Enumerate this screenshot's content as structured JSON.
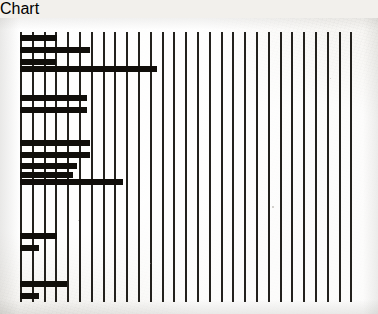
{
  "figure": {
    "title": "",
    "caption": "",
    "background_color": "#f3f1ed",
    "ink_color": "#100e0a"
  },
  "chart_data": {
    "type": "bar",
    "orientation": "horizontal",
    "title": "",
    "subtitle": "",
    "xlabel": "",
    "ylabel": "",
    "grid": true,
    "grid_axis": "x",
    "legend": false,
    "legend_position": "none",
    "axis_ranges": {
      "x_pixels": [
        20,
        362
      ],
      "y_pixels": [
        14,
        284
      ],
      "x_units": [
        0,
        29
      ],
      "y_units": [
        0,
        23
      ]
    },
    "gridline_count": 29,
    "gridline_spacing_px": 11.8,
    "gridline_x_positions": [
      20,
      31.8,
      43.6,
      55.4,
      67.2,
      79,
      90.8,
      102.6,
      114.4,
      126.2,
      138,
      149.8,
      161.6,
      173.4,
      185.2,
      197,
      208.8,
      220.6,
      232.4,
      244.2,
      256,
      267.8,
      279.6,
      291.4,
      303.2,
      315,
      326.8,
      338.6,
      350.4
    ],
    "gridline_top_px": 14,
    "gridline_bottom_px": 284,
    "bar_origin_x_px": 20,
    "bar_height_px": 6,
    "bar_pitch_px": 12,
    "categories": [
      "1",
      "2",
      "3",
      "4",
      "5",
      "6",
      "7",
      "8",
      "9",
      "10",
      "11",
      "12",
      "13",
      "14",
      "15",
      "16",
      "17",
      "18",
      "19",
      "20",
      "21",
      "22",
      "23"
    ],
    "values": [
      3.1,
      0,
      5.9,
      0,
      3.0,
      11.6,
      0,
      0,
      5.7,
      5.7,
      0,
      0,
      5.9,
      4.8,
      4.5,
      8.7,
      0,
      0,
      0,
      3.1,
      1.6,
      0,
      4.0
    ],
    "bars": [
      {
        "index": 0,
        "label": "1",
        "y_px": 17,
        "x_start_px": 20,
        "x_end_px": 57,
        "length_px": 37,
        "value": 3.1
      },
      {
        "index": 1,
        "label": "2",
        "y_px": 29,
        "x_start_px": 20,
        "x_end_px": 90,
        "length_px": 70,
        "value": 5.9
      },
      {
        "index": 2,
        "label": "3",
        "y_px": 41,
        "x_start_px": 20,
        "x_end_px": 56,
        "length_px": 36,
        "value": 3.0
      },
      {
        "index": 3,
        "label": "4",
        "y_px": 48,
        "x_start_px": 20,
        "x_end_px": 157,
        "length_px": 137,
        "value": 11.6
      },
      {
        "index": 4,
        "label": "5",
        "y_px": 77,
        "x_start_px": 20,
        "x_end_px": 87,
        "length_px": 67,
        "value": 5.7
      },
      {
        "index": 5,
        "label": "6",
        "y_px": 89,
        "x_start_px": 20,
        "x_end_px": 87,
        "length_px": 67,
        "value": 5.7
      },
      {
        "index": 6,
        "label": "7",
        "y_px": 122,
        "x_start_px": 20,
        "x_end_px": 90,
        "length_px": 70,
        "value": 5.9
      },
      {
        "index": 7,
        "label": "8",
        "y_px": 134,
        "x_start_px": 20,
        "x_end_px": 90,
        "length_px": 70,
        "value": 5.9
      },
      {
        "index": 8,
        "label": "9",
        "y_px": 145,
        "x_start_px": 20,
        "x_end_px": 77,
        "length_px": 57,
        "value": 4.8
      },
      {
        "index": 9,
        "label": "10",
        "y_px": 154,
        "x_start_px": 20,
        "x_end_px": 73,
        "length_px": 53,
        "value": 4.5
      },
      {
        "index": 10,
        "label": "11",
        "y_px": 161,
        "x_start_px": 20,
        "x_end_px": 123,
        "length_px": 103,
        "value": 8.7
      },
      {
        "index": 11,
        "label": "12",
        "y_px": 215,
        "x_start_px": 20,
        "x_end_px": 57,
        "length_px": 37,
        "value": 3.1
      },
      {
        "index": 12,
        "label": "13",
        "y_px": 227,
        "x_start_px": 20,
        "x_end_px": 39,
        "length_px": 19,
        "value": 1.6
      },
      {
        "index": 13,
        "label": "14",
        "y_px": 263,
        "x_start_px": 20,
        "x_end_px": 67,
        "length_px": 47,
        "value": 4.0
      },
      {
        "index": 14,
        "label": "15",
        "y_px": 275,
        "x_start_px": 20,
        "x_end_px": 39,
        "length_px": 19,
        "value": 1.6
      }
    ]
  },
  "artifacts": {
    "specks": [
      {
        "x_px": 272,
        "y_px": 188,
        "size_px": 2
      },
      {
        "x_px": 78,
        "y_px": 202,
        "size_px": 1
      },
      {
        "x_px": 330,
        "y_px": 60,
        "size_px": 1
      },
      {
        "x_px": 150,
        "y_px": 245,
        "size_px": 1
      }
    ]
  }
}
